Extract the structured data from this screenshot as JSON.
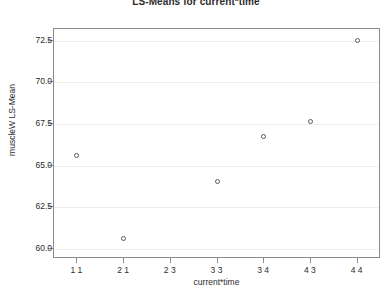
{
  "chart_data": {
    "type": "scatter",
    "title": "LS-Means for current*time",
    "xlabel": "current*time",
    "ylabel": "muscleW LS-Mean",
    "categories": [
      "1 1",
      "2 1",
      "2 3",
      "3 3",
      "3 4",
      "4 3",
      "4 4"
    ],
    "values": [
      65.6,
      60.6,
      null,
      64.0,
      66.7,
      67.6,
      72.5
    ],
    "points": [
      {
        "x": "1 1",
        "y": 65.6
      },
      {
        "x": "2 1",
        "y": 60.6
      },
      {
        "x": "3 3",
        "y": 64.0
      },
      {
        "x": "3 4",
        "y": 66.7
      },
      {
        "x": "4 3",
        "y": 67.6
      },
      {
        "x": "4 4",
        "y": 72.5
      }
    ],
    "ylim": [
      59.4,
      73.2
    ],
    "yticks": [
      60.0,
      62.5,
      65.0,
      67.5,
      70.0,
      72.5
    ],
    "ytick_labels": [
      "60.0",
      "62.5",
      "65.0",
      "67.5",
      "70.0",
      "72.5"
    ],
    "grid": true,
    "grid_axis": "y",
    "legend": null,
    "marker": "open-circle",
    "marker_color": "#5a5a5a",
    "grid_color": "#ededed",
    "axis_color": "#8a8a8a",
    "text_color": "#2b2b2b",
    "background": "#ffffff"
  }
}
